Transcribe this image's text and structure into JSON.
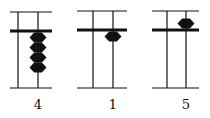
{
  "figure": {
    "ink_color": "#111111",
    "abaci": [
      {
        "value": "4",
        "label": "4",
        "frame": {
          "x1": 10,
          "x2": 52,
          "top": 12,
          "beam": 31,
          "bottom": 88
        },
        "rods": [
          18,
          38
        ],
        "heaven_beads": 0,
        "earth_beads": 4,
        "bead_rod_x": 38
      },
      {
        "value": "1",
        "label": "1",
        "frame": {
          "x1": 77,
          "x2": 127,
          "top": 11,
          "beam": 30,
          "bottom": 88
        },
        "rods": [
          93,
          113
        ],
        "heaven_beads": 0,
        "earth_beads": 1,
        "bead_rod_x": 113
      },
      {
        "value": "5",
        "label": "5",
        "frame": {
          "x1": 152,
          "x2": 199,
          "top": 11,
          "beam": 30,
          "bottom": 88
        },
        "rods": [
          167,
          186
        ],
        "heaven_beads": 1,
        "earth_beads": 0,
        "bead_rod_x": 186
      }
    ]
  }
}
